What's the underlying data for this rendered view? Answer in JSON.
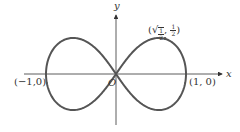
{
  "diagram": {
    "axes": {
      "x_label": "x",
      "y_label": "y",
      "origin_label": "O"
    },
    "points": {
      "left_intercept": "(−1,0)",
      "right_intercept": "(1, 0)",
      "max_point": {
        "prefix": "(",
        "sqrt_symbol": "√",
        "sqrt_num": "1",
        "sqrt_den": "2",
        "separator": ", ",
        "y_num": "1",
        "y_den": "2",
        "suffix": ")"
      }
    },
    "colors": {
      "curve": "#555555",
      "axis": "#333333",
      "background": "#ffffff"
    }
  }
}
